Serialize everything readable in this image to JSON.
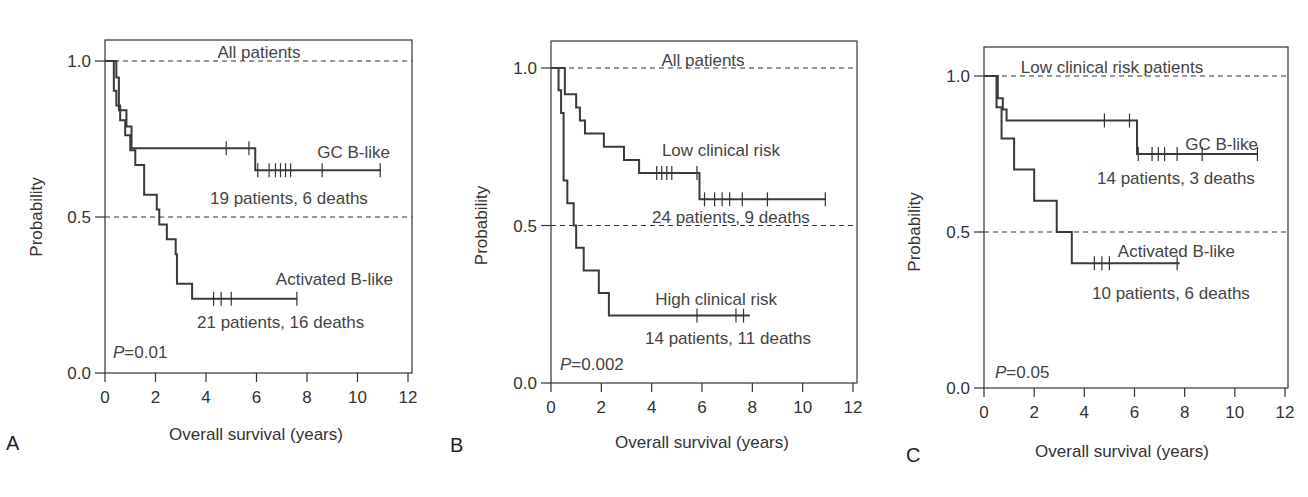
{
  "chart_data": [
    {
      "type": "line",
      "subtype": "kaplan-meier step",
      "panel": "A",
      "title": "All patients",
      "xlabel": "Overall survival (years)",
      "ylabel": "Probability",
      "xlim": [
        0,
        12
      ],
      "ylim": [
        0,
        1
      ],
      "xticks": [
        "0",
        "2",
        "4",
        "6",
        "8",
        "10",
        "12"
      ],
      "yticks": [
        "0.0",
        "0.5",
        "1.0"
      ],
      "reference_lines": [
        0.5,
        1.0
      ],
      "p_value_label": "P",
      "p_value": "=0.01",
      "series": [
        {
          "name": "GC B-like",
          "caption": "19 patients, 6 deaths",
          "steps": [
            [
              0,
              1.0
            ],
            [
              0.45,
              0.947
            ],
            [
              0.55,
              0.842
            ],
            [
              0.85,
              0.79
            ],
            [
              1.05,
              0.72
            ],
            [
              5.95,
              0.65
            ],
            [
              10.9,
              0.65
            ]
          ],
          "censored": [
            [
              4.8,
              0.72
            ],
            [
              5.7,
              0.72
            ],
            [
              6.05,
              0.65
            ],
            [
              6.5,
              0.65
            ],
            [
              6.75,
              0.65
            ],
            [
              6.95,
              0.65
            ],
            [
              7.15,
              0.65
            ],
            [
              7.35,
              0.65
            ],
            [
              8.6,
              0.65
            ],
            [
              10.9,
              0.65
            ]
          ]
        },
        {
          "name": "Activated B-like",
          "caption": "21 patients, 16 deaths",
          "steps": [
            [
              0,
              1.0
            ],
            [
              0.35,
              0.905
            ],
            [
              0.45,
              0.857
            ],
            [
              0.6,
              0.81
            ],
            [
              0.8,
              0.762
            ],
            [
              1.0,
              0.714
            ],
            [
              1.2,
              0.667
            ],
            [
              1.55,
              0.571
            ],
            [
              2.05,
              0.524
            ],
            [
              2.15,
              0.476
            ],
            [
              2.45,
              0.429
            ],
            [
              2.8,
              0.381
            ],
            [
              2.85,
              0.286
            ],
            [
              3.45,
              0.238
            ],
            [
              7.6,
              0.238
            ]
          ],
          "censored": [
            [
              4.3,
              0.238
            ],
            [
              4.6,
              0.238
            ],
            [
              5.0,
              0.238
            ],
            [
              7.6,
              0.238
            ]
          ]
        }
      ]
    },
    {
      "type": "line",
      "subtype": "kaplan-meier step",
      "panel": "B",
      "title": "All patients",
      "xlabel": "Overall survival (years)",
      "ylabel": "Probability",
      "xlim": [
        0,
        12
      ],
      "ylim": [
        0,
        1
      ],
      "xticks": [
        "0",
        "2",
        "4",
        "6",
        "8",
        "10",
        "12"
      ],
      "yticks": [
        "0.0",
        "0.5",
        "1.0"
      ],
      "reference_lines": [
        0.5,
        1.0
      ],
      "p_value_label": "P",
      "p_value": "=0.002",
      "series": [
        {
          "name": "Low clinical risk",
          "caption": "24 patients, 9 deaths",
          "steps": [
            [
              0,
              1.0
            ],
            [
              0.55,
              0.917
            ],
            [
              1.0,
              0.875
            ],
            [
              1.15,
              0.833
            ],
            [
              1.35,
              0.792
            ],
            [
              2.1,
              0.75
            ],
            [
              2.9,
              0.708
            ],
            [
              3.5,
              0.667
            ],
            [
              5.9,
              0.583
            ],
            [
              10.9,
              0.583
            ]
          ],
          "censored": [
            [
              4.2,
              0.667
            ],
            [
              4.4,
              0.667
            ],
            [
              4.6,
              0.667
            ],
            [
              4.8,
              0.667
            ],
            [
              5.8,
              0.667
            ],
            [
              6.1,
              0.583
            ],
            [
              6.5,
              0.583
            ],
            [
              6.8,
              0.583
            ],
            [
              7.1,
              0.583
            ],
            [
              7.6,
              0.583
            ],
            [
              8.6,
              0.583
            ],
            [
              10.9,
              0.583
            ]
          ]
        },
        {
          "name": "High clinical risk",
          "caption": "14 patients, 11 deaths",
          "steps": [
            [
              0,
              1.0
            ],
            [
              0.3,
              0.929
            ],
            [
              0.4,
              0.857
            ],
            [
              0.5,
              0.643
            ],
            [
              0.65,
              0.571
            ],
            [
              0.9,
              0.5
            ],
            [
              1.0,
              0.429
            ],
            [
              1.3,
              0.357
            ],
            [
              1.9,
              0.286
            ],
            [
              2.3,
              0.214
            ],
            [
              7.9,
              0.214
            ]
          ],
          "censored": [
            [
              5.8,
              0.214
            ],
            [
              7.35,
              0.214
            ],
            [
              7.65,
              0.214
            ]
          ]
        }
      ]
    },
    {
      "type": "line",
      "subtype": "kaplan-meier step",
      "panel": "C",
      "title": "Low clinical risk patients",
      "xlabel": "Overall survival (years)",
      "ylabel": "Probability",
      "xlim": [
        0,
        12
      ],
      "ylim": [
        0,
        1
      ],
      "xticks": [
        "0",
        "2",
        "4",
        "6",
        "8",
        "10",
        "12"
      ],
      "yticks": [
        "0.0",
        "0.5",
        "1.0"
      ],
      "reference_lines": [
        0.5,
        1.0
      ],
      "p_value_label": "P",
      "p_value": "=0.05",
      "series": [
        {
          "name": "GC B-like",
          "caption": "14 patients, 3 deaths",
          "steps": [
            [
              0,
              1.0
            ],
            [
              0.55,
              0.929
            ],
            [
              0.75,
              0.893
            ],
            [
              0.9,
              0.857
            ],
            [
              6.1,
              0.75
            ],
            [
              10.9,
              0.75
            ]
          ],
          "censored": [
            [
              4.8,
              0.857
            ],
            [
              5.8,
              0.857
            ],
            [
              6.15,
              0.75
            ],
            [
              6.7,
              0.75
            ],
            [
              6.95,
              0.75
            ],
            [
              7.2,
              0.75
            ],
            [
              7.7,
              0.75
            ],
            [
              8.7,
              0.75
            ],
            [
              10.9,
              0.75
            ]
          ]
        },
        {
          "name": "Activated B-like",
          "caption": "10 patients, 6 deaths",
          "steps": [
            [
              0,
              1.0
            ],
            [
              0.5,
              0.9
            ],
            [
              0.7,
              0.8
            ],
            [
              1.0,
              0.8
            ],
            [
              1.2,
              0.7
            ],
            [
              2.0,
              0.6
            ],
            [
              2.9,
              0.5
            ],
            [
              3.5,
              0.4
            ],
            [
              7.8,
              0.4
            ]
          ],
          "censored": [
            [
              4.4,
              0.4
            ],
            [
              4.7,
              0.4
            ],
            [
              5.0,
              0.4
            ],
            [
              7.7,
              0.4
            ]
          ]
        }
      ]
    }
  ],
  "panels": [
    {
      "letter": "A",
      "title": "All patients",
      "p_label": "P",
      "p_value": "=0.01",
      "series_labels": [
        "GC B-like",
        "Activated B-like"
      ],
      "captions": [
        "19 patients, 6 deaths",
        "21 patients, 16 deaths"
      ]
    },
    {
      "letter": "B",
      "title": "All patients",
      "p_label": "P",
      "p_value": "=0.002",
      "series_labels": [
        "Low clinical risk",
        "High clinical risk"
      ],
      "captions": [
        "24 patients, 9 deaths",
        "14 patients, 11 deaths"
      ]
    },
    {
      "letter": "C",
      "title": "Low clinical risk patients",
      "p_label": "P",
      "p_value": "=0.05",
      "series_labels": [
        "GC B-like",
        "Activated B-like"
      ],
      "captions": [
        "14 patients, 3 deaths",
        "10 patients, 6 deaths"
      ]
    }
  ],
  "axis": {
    "xlabel": "Overall survival (years)",
    "ylabel": "Probability",
    "xticks": [
      "0",
      "2",
      "4",
      "6",
      "8",
      "10",
      "12"
    ],
    "yticks": [
      "0.0",
      "0.5",
      "1.0"
    ]
  },
  "colors": {
    "curve": "#3a3a3a",
    "text": "#444444",
    "frame": "#333333"
  }
}
